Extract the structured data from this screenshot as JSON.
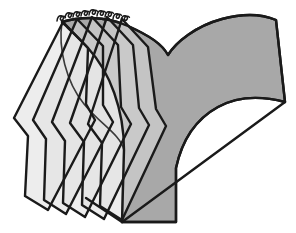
{
  "figure": {
    "title": "Foliation of a pair-of-pants surface by transversal planes",
    "type": "line-drawing",
    "width": 296,
    "height": 233,
    "background_color": "#ffffff"
  },
  "colors": {
    "background": "#ffffff",
    "surface_fill": "#a8a8a8",
    "surface_fill_dark": "#959595",
    "plane_fill_light": "#e2e2e2",
    "plane_fill_mid": "#d2d2d2",
    "plane_fill_shadow": "#bdbdbd",
    "outline": "#1a1a1a",
    "outline_thin": "#2b2b2b"
  },
  "elements": {
    "surface": {
      "name": "pair-of-pants-surface",
      "description": "Large Y shaped grey surface with two upper arms, a central notch and a wide stem",
      "notch_point": [
        168,
        55
      ],
      "right_arm_tip": [
        285,
        102
      ],
      "stem_bottom": [
        150,
        222
      ],
      "path": "M 62,22 C 78,17 104,15 128,26 C 150,36 162,44 168,55 C 176,42 196,26 222,19 C 244,13 262,14 276,20 L 285,102 C 262,96 238,96 218,107 C 196,119 182,140 176,168 L 176,222 L 122,222 L 124,150 C 124,110 110,72 88,48 C 78,37 68,28 62,22 Z"
    },
    "surface_inner_edge": {
      "name": "surface-inner-fold-edge",
      "description": "Inner silhouette fold running down the left side of the stem behind the planes",
      "path": "M 62,22 C 58,48 66,82 84,104 C 100,124 120,134 124,150"
    },
    "baseline": {
      "name": "perspective-baseline",
      "description": "Straight diagonal from the lower left of the stem to the right arm tip",
      "from": [
        122,
        222
      ],
      "to": [
        285,
        102
      ]
    },
    "baseline_left": {
      "name": "perspective-baseline-left",
      "description": "Short diagonal running from the stem base toward the lower left plane edges",
      "from": [
        122,
        222
      ],
      "to": [
        86,
        198
      ]
    },
    "planes": [
      {
        "id": "plane-1",
        "name": "transversal-plane-1",
        "apex": [
          63,
          22
        ],
        "description": "Leftmost slicing plane, elongated hexagon",
        "path": "M 63,22 L 14,118 L 28,136 L 25,196 L 48,210 L 95,120 L 86,104 L 88,48 Z"
      },
      {
        "id": "plane-2",
        "name": "transversal-plane-2",
        "apex": [
          77,
          19
        ],
        "description": "Second slicing plane",
        "path": "M 77,19 L 33,120 L 46,139 L 44,200 L 66,214 L 113,122 L 103,105 L 103,46 Z"
      },
      {
        "id": "plane-3",
        "name": "transversal-plane-3",
        "apex": [
          92,
          17
        ],
        "description": "Third slicing plane",
        "path": "M 92,17 L 52,122 L 65,141 L 63,203 L 85,217 L 131,124 L 121,107 L 118,45 Z"
      },
      {
        "id": "plane-4",
        "name": "transversal-plane-4",
        "apex": [
          107,
          17
        ],
        "description": "Fourth slicing plane",
        "path": "M 107,17 L 70,123 L 84,142 L 82,205 L 104,219 L 149,125 L 139,108 L 133,45 Z"
      },
      {
        "id": "plane-5",
        "name": "transversal-plane-5",
        "apex": [
          122,
          19
        ],
        "description": "Rightmost slicing plane, partially hidden behind the surface",
        "path": "M 122,19 L 88,124 L 102,143 L 100,206 L 122,220 L 166,126 L 156,109 L 148,47 Z"
      }
    ],
    "apex_marks": {
      "name": "apex-curl-marks",
      "count": 9,
      "description": "Small curled hatch marks drawn along the top ridge where the planes meet",
      "positions": [
        [
          61,
          17
        ],
        [
          69,
          14
        ],
        [
          77,
          13
        ],
        [
          85,
          12
        ],
        [
          93,
          11
        ],
        [
          101,
          12
        ],
        [
          109,
          13
        ],
        [
          117,
          15
        ],
        [
          125,
          17
        ]
      ]
    }
  },
  "chart_data": {
    "type": "diagram",
    "series": [
      {
        "name": "surface",
        "count": 1
      },
      {
        "name": "transversal-planes",
        "count": 5
      },
      {
        "name": "apex-curl-marks",
        "count": 9
      }
    ]
  }
}
